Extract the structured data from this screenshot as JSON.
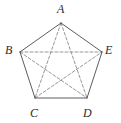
{
  "figure": {
    "canvas": {
      "width": 121,
      "height": 123
    },
    "background_color": "#ffffff",
    "edge_color": "#4a4a4a",
    "diagonal_color": "#8c8c8c",
    "label_color": "#2b2b2b",
    "edge_style": "solid",
    "diagonal_style": "dashed",
    "dash_pattern": "3,2"
  },
  "vertices": [
    {
      "id": "A",
      "label": "A",
      "x": 61,
      "y": 23,
      "label_x": 57,
      "label_y": 3,
      "label_name": "vertex-label-a"
    },
    {
      "id": "B",
      "label": "B",
      "x": 20,
      "y": 52,
      "label_x": 5,
      "label_y": 44,
      "label_name": "vertex-label-b"
    },
    {
      "id": "C",
      "label": "C",
      "x": 35,
      "y": 98,
      "label_x": 30,
      "label_y": 107,
      "label_name": "vertex-label-c"
    },
    {
      "id": "D",
      "label": "D",
      "x": 87,
      "y": 98,
      "label_x": 83,
      "label_y": 107,
      "label_name": "vertex-label-d"
    },
    {
      "id": "E",
      "label": "E",
      "x": 102,
      "y": 52,
      "label_x": 105,
      "label_y": 44,
      "label_name": "vertex-label-e"
    }
  ],
  "edges": [
    {
      "id": "AB",
      "from": "A",
      "to": "B",
      "style": "solid"
    },
    {
      "id": "BC",
      "from": "B",
      "to": "C",
      "style": "solid"
    },
    {
      "id": "CD",
      "from": "C",
      "to": "D",
      "style": "solid"
    },
    {
      "id": "DE",
      "from": "D",
      "to": "E",
      "style": "solid"
    },
    {
      "id": "EA",
      "from": "E",
      "to": "A",
      "style": "solid"
    }
  ],
  "diagonals": [
    {
      "id": "AC",
      "from": "A",
      "to": "C",
      "style": "dashed"
    },
    {
      "id": "AD",
      "from": "A",
      "to": "D",
      "style": "dashed"
    },
    {
      "id": "BD",
      "from": "B",
      "to": "D",
      "style": "dashed"
    },
    {
      "id": "BE",
      "from": "B",
      "to": "E",
      "style": "dashed"
    },
    {
      "id": "CE",
      "from": "C",
      "to": "E",
      "style": "dashed"
    }
  ]
}
